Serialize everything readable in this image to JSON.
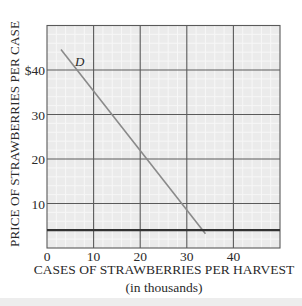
{
  "chart_data": {
    "type": "line",
    "title": "",
    "xlabel": "CASES OF STRAWBERRIES PER HARVEST",
    "xlabel_sub": "(in thousands)",
    "ylabel": "PRICE OF STRAWBERRIES PER CASE",
    "xlim": [
      0,
      50
    ],
    "ylim": [
      0,
      50
    ],
    "x_ticks": [
      0,
      10,
      20,
      30,
      40
    ],
    "x_tick_labels": [
      "0",
      "10",
      "20",
      "30",
      "40"
    ],
    "y_ticks": [
      10,
      20,
      30,
      40
    ],
    "y_tick_labels": [
      "10",
      "20",
      "30",
      "$40"
    ],
    "grid": true,
    "legend": "none",
    "series": [
      {
        "name": "D",
        "label": "D",
        "color": "#8a8a8a",
        "x": [
          3,
          34
        ],
        "y": [
          44.6,
          3.2
        ]
      },
      {
        "name": "horizontal-line",
        "label": "",
        "color": "#333333",
        "x": [
          0,
          50
        ],
        "y": [
          4,
          4
        ]
      }
    ],
    "annotations": [
      {
        "text": "D",
        "x": 6,
        "y": 41
      }
    ]
  },
  "colors": {
    "plot_background": "#ebebeb",
    "minor_grid": "#f7f7f7",
    "major_grid": "#5a5a5a",
    "text": "#2a2a2a"
  }
}
